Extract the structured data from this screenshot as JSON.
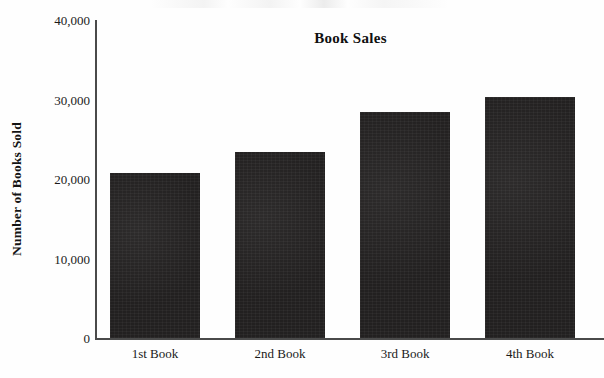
{
  "chart_data": {
    "type": "bar",
    "title": "Book Sales",
    "xlabel": "",
    "ylabel": "Number of Books Sold",
    "categories": [
      "1st Book",
      "2nd Book",
      "3rd Book",
      "4th Book"
    ],
    "values": [
      20700,
      23400,
      28400,
      30300
    ],
    "ylim": [
      0,
      40000
    ],
    "yticks": [
      0,
      10000,
      20000,
      30000,
      40000
    ],
    "ytick_labels": [
      "0",
      "10,000",
      "20,000",
      "30,000",
      "40,000"
    ],
    "grid": false,
    "legend": null,
    "bar_color": "#222020",
    "axis_color": "#4a4a4a",
    "text_color": "#1a1a1a"
  }
}
